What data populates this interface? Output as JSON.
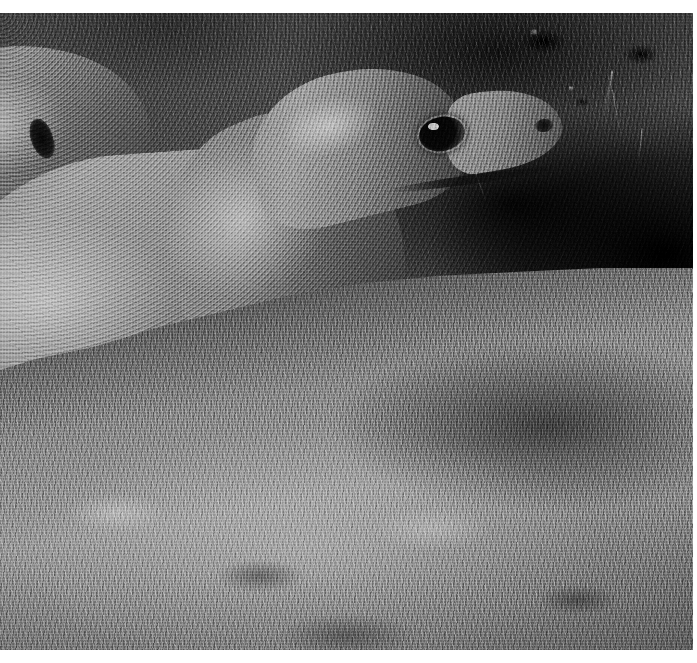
{
  "document": {
    "kind": "halftone-printed black-and-white photograph",
    "page_background": "#ffffff",
    "margins": {
      "top_px": 13,
      "right_px": 4,
      "bottom_px": 13,
      "left_px": 0
    }
  },
  "photo": {
    "title": "Komodo dragons resting on grass",
    "alt_text": "Two Komodo dragons lying on short grass; the nearer animal faces right with head raised, the second animal is partly visible behind it at upper left.",
    "color_mode": "grayscale",
    "print_style": "halftone dot screen"
  },
  "scene": {
    "background": {
      "name": "dark earth bank and shadowed vegetation",
      "tone_hex": "#4b4b4b",
      "shadow_hex": "#0d0d0d"
    },
    "grass": {
      "name": "short lawn grass foreground",
      "highlight_hex": "#9a9a9a",
      "shadow_hex": "#2f2f2f"
    },
    "subjects": [
      {
        "id": "front-dragon",
        "label": "Komodo dragon (foreground)",
        "facing": "right",
        "parts": [
          "head",
          "eye",
          "nostril",
          "snout",
          "neck",
          "body",
          "foreleg",
          "clawed foot",
          "hind body"
        ],
        "skin_tone_hex": "#9a9a9a"
      },
      {
        "id": "rear-dragon",
        "label": "Komodo dragon (behind, upper left)",
        "facing": "left",
        "parts": [
          "head",
          "ear opening",
          "shoulder",
          "back"
        ],
        "skin_tone_hex": "#a6a6a6"
      }
    ]
  },
  "palette": {
    "paper_white": "#ffffff",
    "sky_gray": "#4b4b4b",
    "deep_black": "#0a0a0a",
    "skin_light": "#a8a8a8",
    "grass_light": "#9a9a9a",
    "mid_gray": "#6f6f6f"
  }
}
